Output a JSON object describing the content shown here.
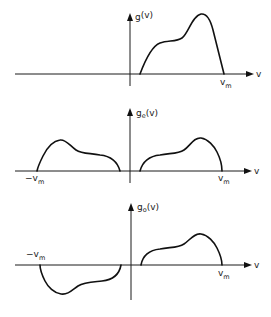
{
  "figure": {
    "panels": [
      {
        "id": "g",
        "ylabel_main": "g",
        "ylabel_sub": "",
        "ylabel_arg": "(v)",
        "xlabel": "v",
        "right_limit_main": "v",
        "right_limit_sub": "m",
        "left_limit_main": "",
        "left_limit_sub": "",
        "description": "Arbitrary function g(v) defined for 0 < v < v_m"
      },
      {
        "id": "ge",
        "ylabel_main": "g",
        "ylabel_sub": "e",
        "ylabel_arg": "(v)",
        "xlabel": "v",
        "right_limit_main": "v",
        "right_limit_sub": "m",
        "left_limit_main": "−v",
        "left_limit_sub": "m",
        "description": "Even extension g_e(v), mirrored about the vertical axis"
      },
      {
        "id": "go",
        "ylabel_main": "g",
        "ylabel_sub": "o",
        "ylabel_arg": "(v)",
        "xlabel": "v",
        "right_limit_main": "v",
        "right_limit_sub": "m",
        "left_limit_main": "−v",
        "left_limit_sub": "m",
        "description": "Odd extension g_o(v), point-reflected through the origin"
      }
    ]
  }
}
